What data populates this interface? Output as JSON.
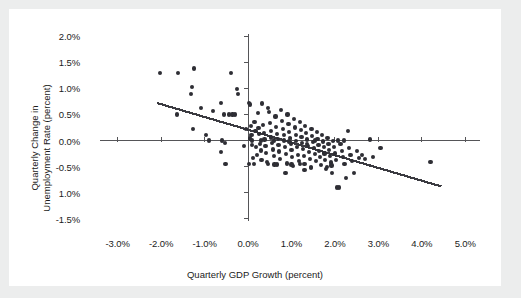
{
  "figure": {
    "background_color": "#eceded",
    "panel_color": "#ffffff",
    "marker_color": "#2e2e34",
    "axis_color": "#555558",
    "trend_color": "#3a3a40"
  },
  "chart_data": {
    "type": "scatter",
    "title": "",
    "xlabel": "Quarterly GDP Growth (percent)",
    "ylabel": "Quarterly Change in Unemployment Rate (percent)",
    "ylabel_line1": "Quarterly Change in",
    "ylabel_line2": "Unemployment Rate (percent)",
    "xlim": [
      -3.5,
      5.5
    ],
    "ylim": [
      -1.6,
      2.1
    ],
    "xticks": [
      -3.0,
      -2.0,
      -1.0,
      0.0,
      1.0,
      2.0,
      3.0,
      4.0,
      5.0
    ],
    "xtick_labels": [
      "-3.0%",
      "-2.0%",
      "-1.0%",
      "0.0%",
      "1.0%",
      "2.0%",
      "3.0%",
      "4.0%",
      "5.0%"
    ],
    "yticks": [
      2.0,
      1.5,
      1.0,
      0.5,
      0.0,
      -0.5,
      -1.0,
      -1.5
    ],
    "ytick_labels": [
      "2.0%",
      "1.5%",
      "1.0%",
      "0.5%",
      "0.0%",
      "-0.5%",
      "1.0%",
      "-1.5%"
    ],
    "grid": false,
    "legend": null,
    "axis_style": "zero-crossing-spines",
    "trendline": {
      "type": "linear-fit",
      "x_start": -2.1,
      "y_start": 0.72,
      "x_end": 4.45,
      "y_end": -0.88,
      "slope_per_percent": -0.244,
      "intercept": 0.208
    },
    "points": [
      [
        -2.02,
        1.29
      ],
      [
        -1.61,
        1.29
      ],
      [
        -1.24,
        1.38
      ],
      [
        -0.4,
        1.29
      ],
      [
        -1.29,
        1.02
      ],
      [
        -0.25,
        0.99
      ],
      [
        -1.31,
        0.9
      ],
      [
        -0.23,
        0.89
      ],
      [
        -1.63,
        0.5
      ],
      [
        -1.09,
        0.63
      ],
      [
        -0.8,
        0.57
      ],
      [
        -0.62,
        0.72
      ],
      [
        -0.55,
        0.5
      ],
      [
        -0.43,
        0.5
      ],
      [
        -0.36,
        0.5
      ],
      [
        -0.3,
        0.5
      ],
      [
        -1.26,
        0.22
      ],
      [
        -0.96,
        0.11
      ],
      [
        -0.89,
        0.0
      ],
      [
        -0.63,
        -0.22
      ],
      [
        -0.6,
        0.0
      ],
      [
        -0.53,
        -0.05
      ],
      [
        -0.52,
        -0.45
      ],
      [
        0.02,
        0.72
      ],
      [
        0.05,
        0.69
      ],
      [
        0.06,
        0.28
      ],
      [
        0.08,
        0.1
      ],
      [
        0.09,
        -0.09
      ],
      [
        0.1,
        0.0
      ],
      [
        0.12,
        -0.33
      ],
      [
        0.13,
        -0.45
      ],
      [
        0.15,
        0.35
      ],
      [
        0.17,
        0.19
      ],
      [
        0.18,
        -0.12
      ],
      [
        0.2,
        -0.28
      ],
      [
        0.22,
        0.53
      ],
      [
        0.24,
        0.24
      ],
      [
        0.26,
        0.12
      ],
      [
        0.27,
        -0.06
      ],
      [
        0.29,
        -0.19
      ],
      [
        0.31,
        -0.37
      ],
      [
        0.33,
        0.71
      ],
      [
        0.35,
        0.3
      ],
      [
        0.37,
        0.15
      ],
      [
        0.38,
        0.02
      ],
      [
        0.4,
        -0.1
      ],
      [
        0.42,
        -0.24
      ],
      [
        0.44,
        -0.41
      ],
      [
        0.46,
        0.62
      ],
      [
        0.48,
        0.55
      ],
      [
        0.5,
        0.33
      ],
      [
        0.52,
        0.19
      ],
      [
        0.53,
        0.06
      ],
      [
        0.55,
        -0.04
      ],
      [
        0.57,
        -0.17
      ],
      [
        0.59,
        -0.3
      ],
      [
        0.61,
        -0.46
      ],
      [
        0.63,
        0.46
      ],
      [
        0.65,
        0.26
      ],
      [
        0.66,
        0.13
      ],
      [
        0.68,
        0.03
      ],
      [
        0.7,
        -0.08
      ],
      [
        0.72,
        -0.21
      ],
      [
        0.74,
        -0.35
      ],
      [
        0.76,
        0.58
      ],
      [
        0.78,
        0.38
      ],
      [
        0.8,
        0.22
      ],
      [
        0.82,
        0.1
      ],
      [
        0.83,
        0.0
      ],
      [
        0.85,
        -0.12
      ],
      [
        0.87,
        -0.26
      ],
      [
        0.89,
        -0.44
      ],
      [
        0.91,
        0.5
      ],
      [
        0.93,
        0.31
      ],
      [
        0.95,
        0.17
      ],
      [
        0.96,
        0.05
      ],
      [
        0.98,
        -0.06
      ],
      [
        1.0,
        -0.18
      ],
      [
        1.02,
        -0.31
      ],
      [
        1.04,
        -0.49
      ],
      [
        1.06,
        0.41
      ],
      [
        1.08,
        0.25
      ],
      [
        1.1,
        0.11
      ],
      [
        1.11,
        -0.01
      ],
      [
        1.13,
        -0.13
      ],
      [
        1.15,
        -0.27
      ],
      [
        1.17,
        -0.4
      ],
      [
        1.19,
        0.36
      ],
      [
        1.21,
        0.2
      ],
      [
        1.23,
        0.07
      ],
      [
        1.24,
        -0.05
      ],
      [
        1.26,
        -0.16
      ],
      [
        1.28,
        -0.3
      ],
      [
        1.3,
        -0.45
      ],
      [
        1.32,
        0.28
      ],
      [
        1.34,
        0.14
      ],
      [
        1.36,
        0.02
      ],
      [
        1.38,
        -0.1
      ],
      [
        1.4,
        -0.22
      ],
      [
        1.42,
        -0.35
      ],
      [
        1.44,
        -0.52
      ],
      [
        1.46,
        0.22
      ],
      [
        1.48,
        0.09
      ],
      [
        1.5,
        -0.03
      ],
      [
        1.52,
        -0.14
      ],
      [
        1.54,
        -0.26
      ],
      [
        1.56,
        -0.39
      ],
      [
        1.58,
        0.16
      ],
      [
        1.6,
        0.03
      ],
      [
        1.62,
        -0.08
      ],
      [
        1.64,
        -0.2
      ],
      [
        1.66,
        -0.32
      ],
      [
        1.68,
        -0.47
      ],
      [
        1.7,
        0.1
      ],
      [
        1.72,
        -0.02
      ],
      [
        1.74,
        -0.13
      ],
      [
        1.76,
        -0.25
      ],
      [
        1.78,
        -0.37
      ],
      [
        1.8,
        -0.55
      ],
      [
        1.83,
        0.05
      ],
      [
        1.85,
        -0.06
      ],
      [
        1.87,
        -0.18
      ],
      [
        1.89,
        -0.3
      ],
      [
        1.91,
        -0.42
      ],
      [
        1.94,
        -0.63
      ],
      [
        1.96,
        -0.01
      ],
      [
        1.98,
        -0.13
      ],
      [
        2.0,
        -0.25
      ],
      [
        2.02,
        -0.38
      ],
      [
        2.04,
        -0.9
      ],
      [
        2.1,
        -0.9
      ],
      [
        2.13,
        -0.07
      ],
      [
        2.16,
        -0.2
      ],
      [
        2.19,
        -0.32
      ],
      [
        2.22,
        -0.45
      ],
      [
        2.25,
        -0.72
      ],
      [
        2.3,
        0.18
      ],
      [
        2.33,
        -0.14
      ],
      [
        2.36,
        -0.27
      ],
      [
        2.4,
        -0.4
      ],
      [
        2.44,
        -0.62
      ],
      [
        2.5,
        -0.2
      ],
      [
        2.55,
        -0.33
      ],
      [
        2.62,
        -0.28
      ],
      [
        2.7,
        -0.36
      ],
      [
        2.8,
        0.02
      ],
      [
        2.88,
        -0.31
      ],
      [
        3.05,
        -0.14
      ],
      [
        4.2,
        -0.41
      ],
      [
        0.04,
        0.04
      ],
      [
        0.6,
        0.0
      ],
      [
        0.95,
        -0.02
      ],
      [
        1.35,
        -0.06
      ],
      [
        1.55,
        0.0
      ],
      [
        2.07,
        0.0
      ],
      [
        2.2,
        0.0
      ],
      [
        0.3,
        0.0
      ],
      [
        -0.1,
        -0.1
      ],
      [
        -0.05,
        0.22
      ],
      [
        0.02,
        -0.45
      ],
      [
        0.45,
        -0.45
      ],
      [
        0.66,
        -0.46
      ],
      [
        1.0,
        -0.46
      ],
      [
        1.2,
        -0.45
      ],
      [
        1.45,
        -0.5
      ],
      [
        0.86,
        -0.62
      ],
      [
        1.3,
        -0.57
      ],
      [
        1.82,
        -0.5
      ],
      [
        1.92,
        -0.48
      ]
    ]
  }
}
